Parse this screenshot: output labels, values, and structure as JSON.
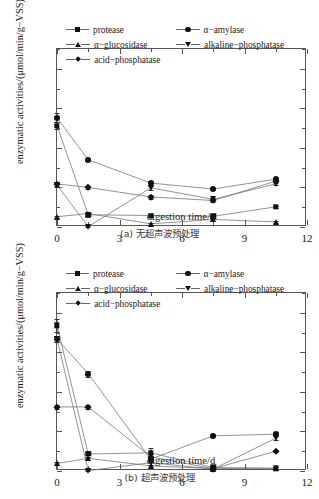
{
  "top_partial_text": "",
  "legend": {
    "entries": [
      {
        "label": "protease",
        "marker": "square"
      },
      {
        "label": "α−amylase",
        "marker": "circle"
      },
      {
        "label": "α−glucosidase",
        "marker": "triangle-up"
      },
      {
        "label": "alkaline−phosphatase",
        "marker": "triangle-down"
      },
      {
        "label": "acid−phosphatase",
        "marker": "diamond"
      }
    ]
  },
  "axes": {
    "xlabel": "digestion time/d",
    "ylabel": "enzymatic activities/(μmol/min/g−VSS)",
    "xticks": [
      "0",
      "3",
      "6",
      "9",
      "12"
    ],
    "yticks": [
      "0",
      "10",
      "20",
      "30",
      "40"
    ]
  },
  "captions": {
    "a": "(a) 无超声波预处理",
    "b": "(b) 超声波预处理"
  },
  "chart_data": [
    {
      "type": "line",
      "id": "panel-a",
      "title": "(a) 无超声波预处理",
      "xlabel": "digestion time/d",
      "ylabel": "enzymatic activities/(μmol/min/g−VSS)",
      "xlim": [
        0,
        12
      ],
      "ylim": [
        0,
        45
      ],
      "xticks": [
        0,
        3,
        6,
        9,
        12
      ],
      "yticks": [
        0,
        10,
        20,
        30,
        40
      ],
      "grid": false,
      "legend_position": "top-left-inside",
      "x": [
        0,
        1.5,
        4.5,
        7.5,
        10.5
      ],
      "series": [
        {
          "name": "protease",
          "marker": "square",
          "values": [
            25.6,
            3.1,
            2.9,
            2.7,
            5.1
          ],
          "errors": [
            0.9,
            0.6,
            0.4,
            0.4,
            0.3
          ]
        },
        {
          "name": "α−amylase",
          "marker": "circle",
          "values": [
            27.6,
            17.0,
            11.1,
            9.6,
            12.1
          ],
          "errors": [
            1.1,
            0.4,
            0.4,
            0.3,
            0.4
          ]
        },
        {
          "name": "α−glucosidase",
          "marker": "triangle-up",
          "values": [
            2.6,
            3.4,
            0.8,
            1.9,
            1.3
          ],
          "errors": [
            0.3,
            0.5,
            0.2,
            0.3,
            0.2
          ]
        },
        {
          "name": "alkaline−phosphatase",
          "marker": "triangle-down",
          "values": [
            10.6,
            0.1,
            9.9,
            7.0,
            10.9
          ],
          "errors": [
            0.4,
            0.2,
            0.5,
            0.4,
            0.4
          ]
        },
        {
          "name": "acid−phosphatase",
          "marker": "diamond",
          "values": [
            10.9,
            10.0,
            7.6,
            6.7,
            11.6
          ],
          "errors": [
            0.5,
            0.3,
            0.4,
            0.4,
            0.4
          ]
        }
      ]
    },
    {
      "type": "line",
      "id": "panel-b",
      "title": "(b) 超声波预处理",
      "xlabel": "digestion time/d",
      "ylabel": "enzymatic activities/(μmol/min/g−VSS)",
      "xlim": [
        0,
        12
      ],
      "ylim": [
        0,
        45
      ],
      "xticks": [
        0,
        3,
        6,
        9,
        12
      ],
      "yticks": [
        0,
        10,
        20,
        30,
        40
      ],
      "grid": false,
      "legend_position": "top-left-inside",
      "x": [
        0,
        1.5,
        4.5,
        7.5,
        10.5
      ],
      "series": [
        {
          "name": "protease",
          "marker": "square",
          "values": [
            36.8,
            4.3,
            4.6,
            0.9,
            0.7
          ],
          "errors": [
            1.6,
            0.7,
            1.1,
            0.4,
            0.3
          ]
        },
        {
          "name": "α−amylase",
          "marker": "circle",
          "values": [
            33.4,
            24.6,
            3.0,
            8.9,
            9.3
          ],
          "errors": [
            0.8,
            0.8,
            0.8,
            0.4,
            0.5
          ]
        },
        {
          "name": "α−glucosidase",
          "marker": "triangle-up",
          "values": [
            1.9,
            3.2,
            1.3,
            0.6,
            0.7
          ],
          "errors": [
            0.3,
            0.4,
            0.3,
            0.2,
            0.2
          ]
        },
        {
          "name": "alkaline−phosphatase",
          "marker": "triangle-down",
          "values": [
            33.4,
            0.1,
            2.1,
            0.5,
            8.3
          ],
          "errors": [
            0.8,
            0.2,
            0.5,
            0.3,
            0.5
          ]
        },
        {
          "name": "acid−phosphatase",
          "marker": "diamond",
          "values": [
            16.2,
            16.2,
            3.6,
            0.6,
            5.0
          ],
          "errors": [
            0.4,
            0.4,
            0.6,
            0.3,
            0.3
          ]
        }
      ]
    }
  ]
}
